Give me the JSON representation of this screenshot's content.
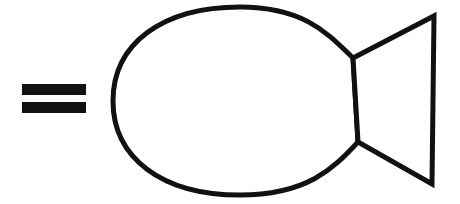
{
  "figure": {
    "title": "Equals sign followed by fish outline",
    "background_color": "#ffffff",
    "stroke_color": "#111111",
    "fill_color": "#ffffff",
    "stroke_width": 5,
    "canvas": {
      "width": 460,
      "height": 204
    },
    "elements": [
      {
        "name": "equals-sign",
        "label": "=",
        "type": "glyph",
        "color": "#111111",
        "bars": [
          {
            "x": 22,
            "y": 84,
            "width": 64,
            "height": 11
          },
          {
            "x": 22,
            "y": 102,
            "width": 64,
            "height": 11
          }
        ]
      },
      {
        "name": "fish-body",
        "label": "fish body",
        "type": "closed-curve",
        "color": "#111111",
        "leftmost_point": {
          "x": 113,
          "y": 101
        },
        "top_point": {
          "x": 240,
          "y": 7
        },
        "bottom_point": {
          "x": 240,
          "y": 195
        },
        "notch_top_vertex": {
          "x": 353,
          "y": 58
        },
        "notch_bottom_vertex": {
          "x": 358,
          "y": 142
        }
      },
      {
        "name": "fish-tail",
        "label": "fish tail",
        "type": "polygon",
        "color": "#111111",
        "top_right_corner": {
          "x": 434,
          "y": 16
        },
        "bottom_right_corner": {
          "x": 432,
          "y": 184
        }
      }
    ]
  },
  "chart_data": {
    "type": "diagram",
    "title": "Equals sign followed by fish outline",
    "shapes": [
      {
        "id": "equals-sign",
        "kind": "equals",
        "glyph": "=",
        "bounds": {
          "x": 22,
          "y": 84,
          "width": 64,
          "height": 29
        }
      },
      {
        "id": "fish",
        "kind": "fish-outline",
        "bounds": {
          "x": 113,
          "y": 6,
          "width": 324,
          "height": 183
        }
      }
    ]
  }
}
